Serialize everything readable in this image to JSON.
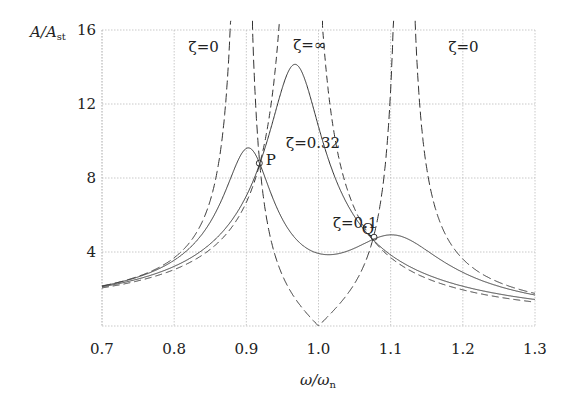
{
  "chart_data": {
    "type": "line",
    "title": "",
    "xlabel": "ω/ω_n",
    "ylabel": "A/A_st",
    "xlim": [
      0.7,
      1.3
    ],
    "ylim": [
      0,
      16
    ],
    "xticks": [
      "0.7",
      "0.8",
      "0.9",
      "1.0",
      "1.1",
      "1.2",
      "1.3"
    ],
    "yticks": [
      "4",
      "8",
      "12",
      "16"
    ],
    "grid": true,
    "model": {
      "mu": 0.05,
      "f": 1.0
    },
    "x": [
      0.7,
      0.8,
      0.85,
      0.9,
      0.95,
      1.0,
      1.05,
      1.1,
      1.15,
      1.2,
      1.3
    ],
    "series": [
      {
        "name": "ζ=0",
        "zeta": 0,
        "style": "long-dash",
        "values": [
          2.16,
          3.69,
          6.78,
          43,
          2.74,
          0,
          2.3,
          12.8,
          8.51,
          3.62,
          1.76
        ]
      },
      {
        "name": "ζ=∞",
        "zeta": "inf",
        "style": "dash",
        "values": [
          2.06,
          3.05,
          4.3,
          6.69,
          19,
          20,
          6.34,
          3.7,
          2.5,
          1.95,
          1.29
        ]
      },
      {
        "name": "ζ=0.32",
        "zeta": 0.32,
        "style": "solid",
        "values": [
          2.1,
          3.4,
          4.9,
          7.6,
          13.8,
          11.0,
          5.8,
          3.7,
          2.8,
          2.3,
          1.6
        ]
      },
      {
        "name": "ζ=0.1",
        "zeta": 0.1,
        "style": "solid",
        "values": [
          2.2,
          3.9,
          6.3,
          9.5,
          6.4,
          4.0,
          4.3,
          4.9,
          3.9,
          2.9,
          1.8
        ]
      }
    ],
    "annotations": [
      {
        "text": "ζ=0",
        "x": 0.82,
        "y": 14.8
      },
      {
        "text": "ζ=∞",
        "x": 0.965,
        "y": 14.9
      },
      {
        "text": "ζ=0",
        "x": 1.18,
        "y": 14.8
      },
      {
        "text": "ζ=0.32",
        "x": 0.955,
        "y": 9.6
      },
      {
        "text": "ζ=0.1",
        "x": 1.02,
        "y": 5.3
      },
      {
        "text": "P",
        "x": 0.927,
        "y": 8.7
      },
      {
        "text": "Q",
        "x": 1.06,
        "y": 5.0
      }
    ],
    "points": [
      {
        "name": "P",
        "x": 0.918,
        "y": 8.8
      },
      {
        "name": "Q",
        "x": 1.077,
        "y": 4.8
      }
    ]
  },
  "axes": {
    "ylabel_main": "A/A",
    "ylabel_sub": "st",
    "xlabel_main": "ω/ω",
    "xlabel_sub": "n"
  }
}
